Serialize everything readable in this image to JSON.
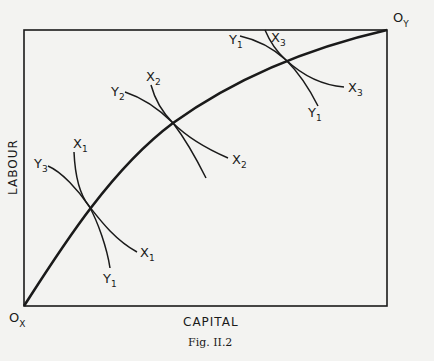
{
  "figure": {
    "caption": "Fig. II.2",
    "x_axis_label": "CAPITAL",
    "y_axis_label": "LABOUR",
    "origin_x": {
      "main": "O",
      "sub": "X"
    },
    "origin_y": {
      "main": "O",
      "sub": "Y"
    }
  },
  "isoquants": {
    "x1_top": {
      "main": "X",
      "sub": "1"
    },
    "x1_end": {
      "main": "X",
      "sub": "1"
    },
    "y3": {
      "main": "Y",
      "sub": "3"
    },
    "y1_low": {
      "main": "Y",
      "sub": "1"
    },
    "x2_top": {
      "main": "X",
      "sub": "2"
    },
    "x2_end": {
      "main": "X",
      "sub": "2"
    },
    "y2": {
      "main": "Y",
      "sub": "2"
    },
    "y1_top": {
      "main": "Y",
      "sub": "1"
    },
    "y1_end": {
      "main": "Y",
      "sub": "1"
    },
    "x3_top": {
      "main": "X",
      "sub": "3"
    },
    "x3_end": {
      "main": "X",
      "sub": "3"
    }
  },
  "colors": {
    "line": "#1a1a1a",
    "background": "#f3f3f1"
  }
}
